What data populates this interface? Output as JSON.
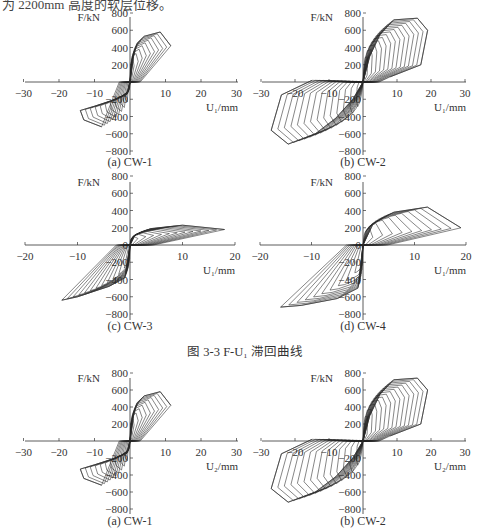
{
  "header_text": "为 2200mm 高度的软层位移。",
  "figure_caption": "图 3-3   F-U₁ 滞回曲线",
  "chart_data": [
    {
      "type": "line",
      "subtype": "hysteresis",
      "panel": "(a) CW-1",
      "xlabel": "U₁/mm",
      "ylabel": "F/kN",
      "xlim": [
        -30,
        30
      ],
      "ylim": [
        -800,
        800
      ],
      "xticks": [
        -30,
        -20,
        -10,
        10,
        20,
        30
      ],
      "yticks": [
        800,
        600,
        400,
        200,
        -200,
        -400,
        -600,
        -800
      ],
      "peak_positive": {
        "x": 8.5,
        "y": 580
      },
      "peak_negative": {
        "x": -14,
        "y": -420
      },
      "max_disp_positive": 11.5,
      "max_disp_negative": -15,
      "envelope_pos": [
        [
          0,
          0
        ],
        [
          1,
          300
        ],
        [
          2,
          450
        ],
        [
          4,
          530
        ],
        [
          8.5,
          580
        ],
        [
          11.5,
          420
        ]
      ],
      "envelope_neg": [
        [
          0,
          0
        ],
        [
          -1,
          -150
        ],
        [
          -4,
          -200
        ],
        [
          -10,
          -280
        ],
        [
          -14,
          -330
        ],
        [
          -13,
          -440
        ],
        [
          -8,
          -520
        ]
      ],
      "loops": 10
    },
    {
      "type": "line",
      "subtype": "hysteresis",
      "panel": "(b) CW-2",
      "xlabel": "U₁/mm",
      "ylabel": "F/kN",
      "xlim": [
        -30,
        30
      ],
      "ylim": [
        -800,
        800
      ],
      "xticks": [
        -30,
        -20,
        -10,
        10,
        20,
        30
      ],
      "yticks": [
        800,
        600,
        400,
        200,
        -200,
        -400,
        -600,
        -800
      ],
      "peak_positive": {
        "x": 16,
        "y": 740
      },
      "peak_negative": {
        "x": -22,
        "y": -720
      },
      "max_disp_positive": 19,
      "max_disp_negative": -27,
      "envelope_pos": [
        [
          0,
          0
        ],
        [
          2,
          300
        ],
        [
          5,
          550
        ],
        [
          9,
          720
        ],
        [
          16,
          740
        ],
        [
          19,
          600
        ],
        [
          17,
          200
        ],
        [
          8,
          60
        ]
      ],
      "envelope_neg": [
        [
          0,
          0
        ],
        [
          -3,
          -200
        ],
        [
          -8,
          -420
        ],
        [
          -14,
          -600
        ],
        [
          -22,
          -720
        ],
        [
          -27,
          -560
        ],
        [
          -24,
          -150
        ],
        [
          -15,
          20
        ]
      ],
      "loops": 14
    },
    {
      "type": "line",
      "subtype": "hysteresis",
      "panel": "(c) CW-3",
      "xlabel": "U₁/mm",
      "ylabel": "F/kN",
      "xlim": [
        -20,
        20
      ],
      "ylim": [
        -800,
        800
      ],
      "xticks": [
        -20,
        -10,
        10,
        20
      ],
      "yticks": [
        800,
        600,
        400,
        200,
        0,
        -200,
        -400,
        -600,
        -800
      ],
      "peak_positive": {
        "x": 10,
        "y": 230
      },
      "peak_negative": {
        "x": -13,
        "y": -640
      },
      "max_disp_positive": 18,
      "max_disp_negative": -13,
      "envelope_pos": [
        [
          0,
          0
        ],
        [
          1,
          120
        ],
        [
          4,
          190
        ],
        [
          10,
          230
        ],
        [
          18,
          180
        ]
      ],
      "envelope_neg": [
        [
          0,
          0
        ],
        [
          -1,
          -380
        ],
        [
          -4,
          -480
        ],
        [
          -10,
          -600
        ],
        [
          -13,
          -640
        ]
      ],
      "loops": 12
    },
    {
      "type": "line",
      "subtype": "hysteresis",
      "panel": "(d) CW-4",
      "xlabel": "U₁/mm",
      "ylabel": "F/kN",
      "xlim": [
        -20,
        20
      ],
      "ylim": [
        -800,
        800
      ],
      "xticks": [
        -20,
        -10,
        10,
        20
      ],
      "yticks": [
        800,
        600,
        400,
        200,
        0,
        -200,
        -400,
        -600,
        -800
      ],
      "peak_positive": {
        "x": 12.5,
        "y": 440
      },
      "peak_negative": {
        "x": -16,
        "y": -700
      },
      "max_disp_positive": 19,
      "max_disp_negative": -16,
      "envelope_pos": [
        [
          0,
          0
        ],
        [
          2,
          250
        ],
        [
          6,
          380
        ],
        [
          12.5,
          440
        ],
        [
          19,
          200
        ]
      ],
      "envelope_neg": [
        [
          0,
          0
        ],
        [
          -1,
          -500
        ],
        [
          -5,
          -620
        ],
        [
          -12,
          -700
        ],
        [
          -16,
          -720
        ]
      ],
      "loops": 10
    },
    {
      "type": "line",
      "subtype": "hysteresis",
      "panel": "(a) CW-1",
      "xlabel": "U₂/mm",
      "ylabel": "F/kN",
      "xlim": [
        -30,
        30
      ],
      "ylim": [
        -800,
        800
      ],
      "xticks": [
        -30,
        -20,
        -10,
        10,
        20,
        30
      ],
      "yticks": [
        800,
        600,
        400,
        200,
        -200,
        -400,
        -600,
        -800
      ],
      "peak_positive": {
        "x": 8.5,
        "y": 580
      },
      "peak_negative": {
        "x": -14,
        "y": -420
      },
      "max_disp_positive": 11.5,
      "max_disp_negative": -15,
      "envelope_pos": [
        [
          0,
          0
        ],
        [
          1,
          300
        ],
        [
          2,
          450
        ],
        [
          4,
          530
        ],
        [
          8.5,
          580
        ],
        [
          11.5,
          420
        ]
      ],
      "envelope_neg": [
        [
          0,
          0
        ],
        [
          -1,
          -150
        ],
        [
          -4,
          -200
        ],
        [
          -10,
          -280
        ],
        [
          -14,
          -330
        ],
        [
          -13,
          -440
        ],
        [
          -8,
          -520
        ]
      ],
      "loops": 10
    },
    {
      "type": "line",
      "subtype": "hysteresis",
      "panel": "(b) CW-2",
      "xlabel": "U₂/mm",
      "ylabel": "F/kN",
      "xlim": [
        -30,
        30
      ],
      "ylim": [
        -800,
        800
      ],
      "xticks": [
        -30,
        -20,
        -10,
        10,
        20,
        30
      ],
      "yticks": [
        800,
        600,
        400,
        200,
        -200,
        -400,
        -600,
        -800
      ],
      "peak_positive": {
        "x": 16,
        "y": 740
      },
      "peak_negative": {
        "x": -22,
        "y": -720
      },
      "max_disp_positive": 19,
      "max_disp_negative": -27,
      "envelope_pos": [
        [
          0,
          0
        ],
        [
          2,
          300
        ],
        [
          5,
          550
        ],
        [
          9,
          720
        ],
        [
          16,
          740
        ],
        [
          19,
          600
        ],
        [
          17,
          200
        ],
        [
          8,
          60
        ]
      ],
      "envelope_neg": [
        [
          0,
          0
        ],
        [
          -3,
          -200
        ],
        [
          -8,
          -420
        ],
        [
          -14,
          -600
        ],
        [
          -22,
          -720
        ],
        [
          -27,
          -560
        ],
        [
          -24,
          -150
        ],
        [
          -15,
          20
        ]
      ],
      "loops": 14
    }
  ],
  "layout": [
    {
      "ox": 130,
      "oy": 82,
      "xpx": [
        25,
        238
      ],
      "ypx": [
        17,
        155
      ],
      "caption_y": 166,
      "label_x": -10
    },
    {
      "ox": 363,
      "oy": 82,
      "xpx": [
        262,
        466
      ],
      "ypx": [
        17,
        155
      ],
      "caption_y": 166,
      "label_x": -10
    },
    {
      "ox": 130,
      "oy": 245,
      "xpx": [
        25,
        235
      ],
      "ypx": [
        182,
        320
      ],
      "caption_y": 330,
      "label_x": -10
    },
    {
      "ox": 363,
      "oy": 245,
      "xpx": [
        260,
        466
      ],
      "ypx": [
        182,
        320
      ],
      "caption_y": 330,
      "label_x": -10
    },
    {
      "ox": 130,
      "oy": 441,
      "xpx": [
        25,
        238
      ],
      "ypx": [
        378,
        514
      ],
      "caption_y": 525,
      "label_x": -10
    },
    {
      "ox": 363,
      "oy": 441,
      "xpx": [
        262,
        466
      ],
      "ypx": [
        378,
        514
      ],
      "caption_y": 525,
      "label_x": -10
    }
  ]
}
